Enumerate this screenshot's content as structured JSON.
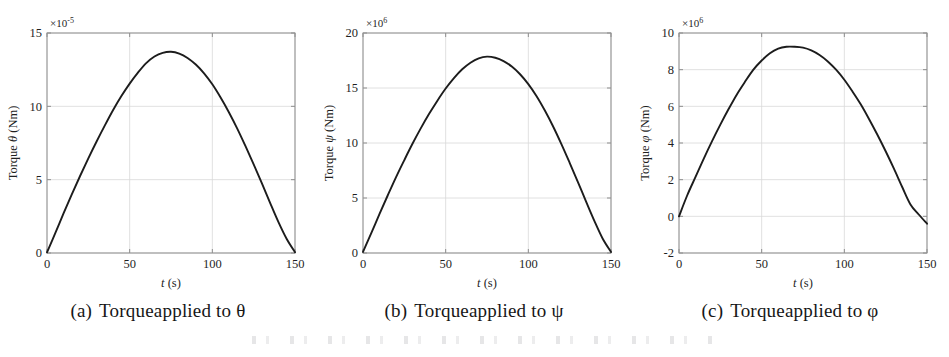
{
  "figure": {
    "panel_count": 3,
    "line_color": "#1c1c1c",
    "grid_color": "#d8d8d8",
    "axis_color": "#8f8f8f",
    "background": "#ffffff"
  },
  "panels": [
    {
      "id": "a",
      "caption_tag": "(a)",
      "caption_text": "Torqueapplied to θ",
      "exponent_prefix": "×10",
      "exponent_power": "-5",
      "ylabel": "Torque θ (Nm)",
      "ylabel_symbol": "θ",
      "xlabel": "t (s)",
      "xlabel_symbol": "t",
      "xlabel_unit": "(s)",
      "xticks": [
        "0",
        "50",
        "100",
        "150"
      ],
      "yticks": [
        "0",
        "5",
        "10",
        "15"
      ]
    },
    {
      "id": "b",
      "caption_tag": "(b)",
      "caption_text": "Torqueapplied to ψ",
      "exponent_prefix": "×10",
      "exponent_power": "6",
      "ylabel": "Torque ψ (Nm)",
      "ylabel_symbol": "ψ",
      "xlabel": "t (s)",
      "xlabel_symbol": "t",
      "xlabel_unit": "(s)",
      "xticks": [
        "0",
        "50",
        "100",
        "150"
      ],
      "yticks": [
        "0",
        "5",
        "10",
        "15",
        "20"
      ]
    },
    {
      "id": "c",
      "caption_tag": "(c)",
      "caption_text": "Torqueapplied to φ",
      "exponent_prefix": "×10",
      "exponent_power": "6",
      "ylabel": "Torque φ (Nm)",
      "ylabel_symbol": "φ",
      "xlabel": "t (s)",
      "xlabel_symbol": "t",
      "xlabel_unit": "(s)",
      "xticks": [
        "0",
        "50",
        "100",
        "150"
      ],
      "yticks": [
        "-2",
        "0",
        "2",
        "4",
        "6",
        "8",
        "10"
      ]
    }
  ],
  "chart_data": [
    {
      "type": "line",
      "title": "(a) Torqueapplied to θ",
      "xlabel": "t (s)",
      "ylabel": "Torque θ (Nm)",
      "y_exponent": -5,
      "y_exponent_label": "×10-5",
      "xlim": [
        0,
        150
      ],
      "ylim": [
        0,
        15
      ],
      "xticks": [
        0,
        50,
        100,
        150
      ],
      "yticks": [
        0,
        5,
        10,
        15
      ],
      "grid": true,
      "legend": "none",
      "series": [
        {
          "name": "Torque theta",
          "x": [
            0,
            5,
            10,
            15,
            20,
            25,
            30,
            35,
            40,
            45,
            50,
            55,
            60,
            65,
            70,
            75,
            80,
            85,
            90,
            95,
            100,
            105,
            110,
            115,
            120,
            125,
            130,
            135,
            140,
            145,
            150
          ],
          "values": [
            0.05,
            1.35,
            2.7,
            4.0,
            5.25,
            6.45,
            7.6,
            8.7,
            9.75,
            10.7,
            11.55,
            12.3,
            12.95,
            13.4,
            13.65,
            13.72,
            13.6,
            13.3,
            12.85,
            12.25,
            11.5,
            10.6,
            9.6,
            8.5,
            7.3,
            6.05,
            4.75,
            3.4,
            2.1,
            0.95,
            0.05
          ]
        }
      ]
    },
    {
      "type": "line",
      "title": "(b) Torqueapplied to ψ",
      "xlabel": "t (s)",
      "ylabel": "Torque ψ (Nm)",
      "y_exponent": 6,
      "y_exponent_label": "×106",
      "xlim": [
        0,
        150
      ],
      "ylim": [
        0,
        20
      ],
      "xticks": [
        0,
        50,
        100,
        150
      ],
      "yticks": [
        0,
        5,
        10,
        15,
        20
      ],
      "grid": true,
      "legend": "none",
      "series": [
        {
          "name": "Torque psi",
          "x": [
            0,
            5,
            10,
            15,
            20,
            25,
            30,
            35,
            40,
            45,
            50,
            55,
            60,
            65,
            70,
            75,
            80,
            85,
            90,
            95,
            100,
            105,
            110,
            115,
            120,
            125,
            130,
            135,
            140,
            145,
            150
          ],
          "values": [
            0.1,
            1.8,
            3.55,
            5.25,
            6.9,
            8.45,
            9.95,
            11.35,
            12.65,
            13.85,
            14.95,
            15.9,
            16.7,
            17.3,
            17.7,
            17.85,
            17.75,
            17.45,
            16.95,
            16.25,
            15.35,
            14.25,
            12.95,
            11.5,
            9.9,
            8.2,
            6.45,
            4.65,
            2.9,
            1.3,
            0.1
          ]
        }
      ]
    },
    {
      "type": "line",
      "title": "(c) Torqueapplied to φ",
      "xlabel": "t (s)",
      "ylabel": "Torque φ (Nm)",
      "y_exponent": 6,
      "y_exponent_label": "×106",
      "xlim": [
        0,
        150
      ],
      "ylim": [
        -2,
        10
      ],
      "xticks": [
        0,
        50,
        100,
        150
      ],
      "yticks": [
        -2,
        0,
        2,
        4,
        6,
        8,
        10
      ],
      "grid": true,
      "legend": "none",
      "series": [
        {
          "name": "Torque phi",
          "x": [
            0,
            5,
            10,
            15,
            20,
            25,
            30,
            35,
            40,
            45,
            50,
            55,
            60,
            65,
            70,
            75,
            80,
            85,
            90,
            95,
            100,
            105,
            110,
            115,
            120,
            125,
            130,
            135,
            140,
            145,
            150
          ],
          "values": [
            0.0,
            1.15,
            2.15,
            3.15,
            4.1,
            5.0,
            5.85,
            6.65,
            7.35,
            8.0,
            8.5,
            8.9,
            9.15,
            9.25,
            9.25,
            9.2,
            9.05,
            8.8,
            8.45,
            8.0,
            7.45,
            6.8,
            6.1,
            5.3,
            4.45,
            3.55,
            2.6,
            1.6,
            0.65,
            0.1,
            -0.4
          ]
        }
      ]
    }
  ]
}
